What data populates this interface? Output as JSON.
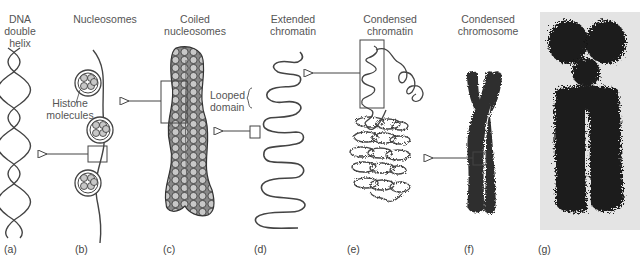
{
  "figure": {
    "stages": [
      {
        "id": "a",
        "panel": "(a)",
        "title": "DNA double helix"
      },
      {
        "id": "b",
        "panel": "(b)",
        "title": "Nucleosomes"
      },
      {
        "id": "c",
        "panel": "(c)",
        "title": "Coiled nucleosomes"
      },
      {
        "id": "d",
        "panel": "(d)",
        "title": "Extended chromatin"
      },
      {
        "id": "e",
        "panel": "(e)",
        "title": "Condensed chromatin"
      },
      {
        "id": "f",
        "panel": "(f)",
        "title": "Condensed chromosome"
      },
      {
        "id": "g",
        "panel": "(g)",
        "title": ""
      }
    ],
    "labels": {
      "a_line1": "DNA",
      "a_line2": "double",
      "a_line3": "helix",
      "b": "Nucleosomes",
      "c_line1": "Coiled",
      "c_line2": "nucleosomes",
      "d_line1": "Extended",
      "d_line2": "chromatin",
      "e_line1": "Condensed",
      "e_line2": "chromatin",
      "f_line1": "Condensed",
      "f_line2": "chromosome",
      "histone_line1": "Histone",
      "histone_line2": "molecules",
      "looped_line1": "Looped",
      "looped_line2": "domain"
    },
    "panels": {
      "a": "(a)",
      "b": "(b)",
      "c": "(c)",
      "d": "(d)",
      "e": "(e)",
      "f": "(f)",
      "g": "(g)"
    },
    "colors": {
      "line": "#444444",
      "chromosome": "#2e2e2e",
      "nucleosome": "#c8c8c8",
      "photo_bg": "#e4e4e4"
    }
  }
}
